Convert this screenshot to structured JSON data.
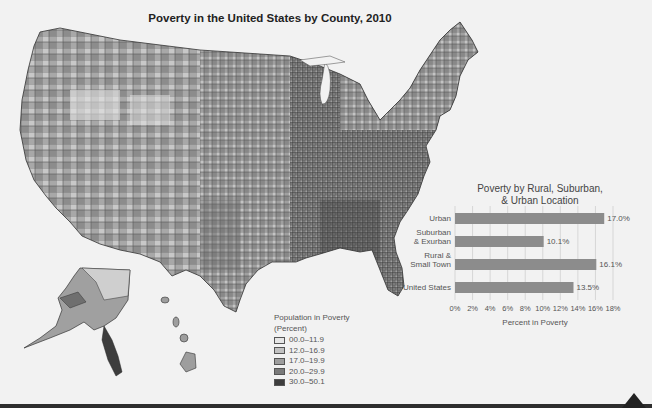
{
  "figure": {
    "title": "Poverty in the United States by County, 2010"
  },
  "legend": {
    "title_line1": "Population in Poverty",
    "title_line2": "(Percent)",
    "items": [
      {
        "label": "00.0–11.9",
        "color": "#e6e6e6"
      },
      {
        "label": "12.0–16.9",
        "color": "#c2c2c2"
      },
      {
        "label": "17.0–19.9",
        "color": "#9e9e9e"
      },
      {
        "label": "20.0–29.9",
        "color": "#7a7a7a"
      },
      {
        "label": "30.0–50.1",
        "color": "#3d3d3d"
      }
    ]
  },
  "chart_data": {
    "type": "bar",
    "orientation": "horizontal",
    "title": "Poverty by Rural, Suburban, & Urban Location",
    "title_line1": "Poverty by Rural, Suburban,",
    "title_line2": "& Urban Location",
    "categories": [
      "Urban",
      "Suburban & Exurban",
      "Rural & Small Town",
      "United States"
    ],
    "category_lines": [
      [
        "Urban"
      ],
      [
        "Suburban",
        "& Exurban"
      ],
      [
        "Rural &",
        "Small Town"
      ],
      [
        "United States"
      ]
    ],
    "values": [
      17.0,
      10.1,
      16.1,
      13.5
    ],
    "value_labels": [
      "17.0%",
      "10.1%",
      "16.1%",
      "13.5%"
    ],
    "xlabel": "Percent in Poverty",
    "ylabel": "",
    "xlim": [
      0,
      18
    ],
    "xticks": [
      "0%",
      "2%",
      "4%",
      "6%",
      "8%",
      "10%",
      "12%",
      "14%",
      "16%",
      "18%"
    ],
    "grid": true,
    "bar_color": "#8c8c8c"
  }
}
